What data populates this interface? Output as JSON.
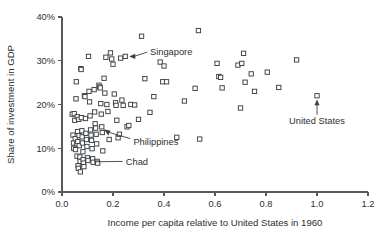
{
  "chart_data": {
    "type": "scatter",
    "title": "",
    "xlabel": "Income per capita relative to United States in 1960",
    "ylabel": "Share of investment in GDP",
    "xlim": [
      0.0,
      1.2
    ],
    "ylim": [
      0,
      40
    ],
    "grid": false,
    "legend": null,
    "xticks": [
      "0.0",
      "0.2",
      "0.4",
      "0.6",
      "0.8",
      "1.0",
      "1.2"
    ],
    "xtick_values": [
      0.0,
      0.2,
      0.4,
      0.6,
      0.8,
      1.0,
      1.2
    ],
    "yticks": [
      "0%",
      "10%",
      "20%",
      "30%",
      "40%"
    ],
    "ytick_values": [
      0,
      10,
      20,
      30,
      40
    ],
    "marker_style": "open-square",
    "marker_fill": "#ffffff",
    "marker_stroke": "#3b3f43",
    "axis_color": "#555a5e",
    "text_color": "#2b2f33",
    "points": [
      [
        0.04,
        17.8
      ],
      [
        0.043,
        13.0
      ],
      [
        0.045,
        11.2
      ],
      [
        0.046,
        10.0
      ],
      [
        0.048,
        17.9
      ],
      [
        0.05,
        16.4
      ],
      [
        0.052,
        12.2
      ],
      [
        0.053,
        9.7
      ],
      [
        0.055,
        21.3
      ],
      [
        0.056,
        25.2
      ],
      [
        0.058,
        11.0
      ],
      [
        0.059,
        8.2
      ],
      [
        0.06,
        17.2
      ],
      [
        0.061,
        13.8
      ],
      [
        0.062,
        11.5
      ],
      [
        0.063,
        6.0
      ],
      [
        0.064,
        5.4
      ],
      [
        0.066,
        16.6
      ],
      [
        0.067,
        12.9
      ],
      [
        0.068,
        10.6
      ],
      [
        0.07,
        8.0
      ],
      [
        0.071,
        7.0
      ],
      [
        0.072,
        4.6
      ],
      [
        0.074,
        28.2
      ],
      [
        0.075,
        28.0
      ],
      [
        0.076,
        17.0
      ],
      [
        0.078,
        14.0
      ],
      [
        0.079,
        12.6
      ],
      [
        0.08,
        11.2
      ],
      [
        0.082,
        9.2
      ],
      [
        0.083,
        7.4
      ],
      [
        0.084,
        6.6
      ],
      [
        0.086,
        5.8
      ],
      [
        0.088,
        22.0
      ],
      [
        0.09,
        21.8
      ],
      [
        0.092,
        16.8
      ],
      [
        0.094,
        13.4
      ],
      [
        0.096,
        12.0
      ],
      [
        0.098,
        10.4
      ],
      [
        0.1,
        7.8
      ],
      [
        0.102,
        7.2
      ],
      [
        0.104,
        31.0
      ],
      [
        0.106,
        23.0
      ],
      [
        0.108,
        20.6
      ],
      [
        0.11,
        17.4
      ],
      [
        0.112,
        14.2
      ],
      [
        0.114,
        13.0
      ],
      [
        0.116,
        11.8
      ],
      [
        0.118,
        9.9
      ],
      [
        0.12,
        7.6
      ],
      [
        0.122,
        6.8
      ],
      [
        0.126,
        23.4
      ],
      [
        0.128,
        18.3
      ],
      [
        0.13,
        15.6
      ],
      [
        0.132,
        14.6
      ],
      [
        0.134,
        13.2
      ],
      [
        0.136,
        11.0
      ],
      [
        0.138,
        7.0
      ],
      [
        0.14,
        6.6
      ],
      [
        0.145,
        24.4
      ],
      [
        0.148,
        24.0
      ],
      [
        0.15,
        23.8
      ],
      [
        0.152,
        20.2
      ],
      [
        0.154,
        17.8
      ],
      [
        0.156,
        14.9
      ],
      [
        0.158,
        13.6
      ],
      [
        0.16,
        9.4
      ],
      [
        0.165,
        26.0
      ],
      [
        0.168,
        22.6
      ],
      [
        0.172,
        30.8
      ],
      [
        0.176,
        20.0
      ],
      [
        0.18,
        18.4
      ],
      [
        0.185,
        12.0
      ],
      [
        0.19,
        31.8
      ],
      [
        0.195,
        30.4
      ],
      [
        0.2,
        29.2
      ],
      [
        0.205,
        22.4
      ],
      [
        0.21,
        20.4
      ],
      [
        0.212,
        19.8
      ],
      [
        0.215,
        16.4
      ],
      [
        0.22,
        12.4
      ],
      [
        0.225,
        13.2
      ],
      [
        0.23,
        30.6
      ],
      [
        0.235,
        21.0
      ],
      [
        0.24,
        19.8
      ],
      [
        0.248,
        31.0
      ],
      [
        0.255,
        14.9
      ],
      [
        0.262,
        15.2
      ],
      [
        0.27,
        20.0
      ],
      [
        0.285,
        19.9
      ],
      [
        0.3,
        16.6
      ],
      [
        0.312,
        35.6
      ],
      [
        0.325,
        25.9
      ],
      [
        0.345,
        18.2
      ],
      [
        0.36,
        21.8
      ],
      [
        0.385,
        29.7
      ],
      [
        0.395,
        25.2
      ],
      [
        0.4,
        28.8
      ],
      [
        0.41,
        25.2
      ],
      [
        0.45,
        12.5
      ],
      [
        0.48,
        20.8
      ],
      [
        0.522,
        23.7
      ],
      [
        0.535,
        36.9
      ],
      [
        0.54,
        12.1
      ],
      [
        0.608,
        29.4
      ],
      [
        0.615,
        26.4
      ],
      [
        0.622,
        26.2
      ],
      [
        0.628,
        23.8
      ],
      [
        0.69,
        29.0
      ],
      [
        0.7,
        19.2
      ],
      [
        0.705,
        29.4
      ],
      [
        0.712,
        31.7
      ],
      [
        0.718,
        25.1
      ],
      [
        0.742,
        27.0
      ],
      [
        0.755,
        23.0
      ],
      [
        0.805,
        27.4
      ],
      [
        0.85,
        23.9
      ],
      [
        0.92,
        30.2
      ],
      [
        1.0,
        22.0
      ]
    ],
    "annotations": [
      {
        "label": "Singapore",
        "point": [
          0.248,
          31.0
        ],
        "label_pos": [
          0.345,
          32.0
        ],
        "arrow": "left"
      },
      {
        "label": "Philippines",
        "point": [
          0.152,
          14.6
        ],
        "label_pos": [
          0.28,
          11.4
        ],
        "arrow": "up-left"
      },
      {
        "label": "Chad",
        "point": [
          0.118,
          6.9
        ],
        "label_pos": [
          0.25,
          7.0
        ],
        "arrow": "none"
      },
      {
        "label": "United States",
        "point": [
          1.0,
          22.0
        ],
        "label_pos": [
          1.0,
          15.6
        ],
        "arrow": "up"
      }
    ]
  }
}
